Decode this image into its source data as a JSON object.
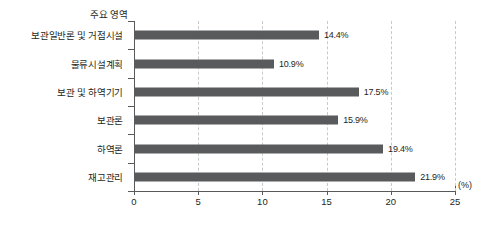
{
  "chart_data": {
    "type": "bar",
    "orientation": "horizontal",
    "title": "",
    "axis_title": "주요 영역",
    "categories": [
      "보관일반론 및 거점시설",
      "물류시설계획",
      "보관 및 하역기기",
      "보관론",
      "하역론",
      "재고관리"
    ],
    "values": [
      14.4,
      10.9,
      17.5,
      15.9,
      19.4,
      21.9
    ],
    "value_labels": [
      "14.4%",
      "10.9%",
      "17.5%",
      "15.9%",
      "19.4%",
      "21.9%"
    ],
    "xlabel": "",
    "ylabel": "",
    "unit": "(%)",
    "xlim": [
      0,
      25
    ],
    "xticks": [
      0,
      5,
      10,
      15,
      20,
      25
    ],
    "xtick_labels": [
      "0",
      "5",
      "10",
      "15",
      "20",
      "25"
    ],
    "grid": true,
    "grid_axis": "x",
    "grid_style": "dashed",
    "legend": false,
    "colors": {
      "bar": "#595a5c",
      "axis": "#58595b",
      "gridline": "#c8c9ca",
      "text": "#231f20",
      "background": "#ffffff"
    }
  }
}
